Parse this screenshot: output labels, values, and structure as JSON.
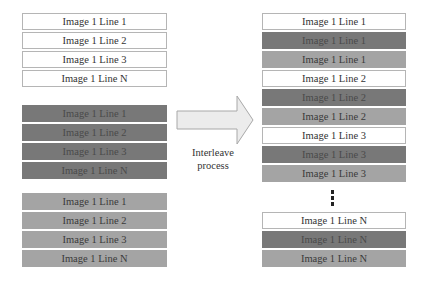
{
  "diagram": {
    "colors": {
      "white": "#ffffff",
      "dark": "#787878",
      "light": "#a4a4a4",
      "arrow": "#ececec",
      "border": "#b5b5b5"
    },
    "left": {
      "groups": [
        {
          "style": "white",
          "rows": [
            "Image 1 Line 1",
            "Image 1 Line 2",
            "Image 1 Line 3",
            "Image 1 Line N"
          ]
        },
        {
          "style": "dark",
          "rows": [
            "Image 1 Line 1",
            "Image 1 Line 2",
            "Image 1 Line 3",
            "Image 1 Line N"
          ]
        },
        {
          "style": "light",
          "rows": [
            "Image 1 Line 1",
            "Image 1 Line 2",
            "Image 1 Line 3",
            "Image 1 Line N"
          ]
        }
      ]
    },
    "arrow": {
      "label_line1": "Interleave",
      "label_line2": "process"
    },
    "right": {
      "rows": [
        {
          "style": "white",
          "text": "Image 1 Line 1"
        },
        {
          "style": "dark",
          "text": "Image 1 Line 1"
        },
        {
          "style": "light",
          "text": "Image 1 Line 1"
        },
        {
          "style": "white",
          "text": "Image 1 Line 2"
        },
        {
          "style": "dark",
          "text": "Image 1 Line 2"
        },
        {
          "style": "light",
          "text": "Image 1 Line 2"
        },
        {
          "style": "white",
          "text": "Image 1 Line 3"
        },
        {
          "style": "dark",
          "text": "Image 1 Line 3"
        },
        {
          "style": "light",
          "text": "Image 1 Line 3"
        },
        {
          "style": "white",
          "text": "Image 1 Line N"
        },
        {
          "style": "dark",
          "text": "Image 1 Line N"
        },
        {
          "style": "light",
          "text": "Image 1 Line N"
        }
      ],
      "ellipsis": "vertical-dots"
    }
  }
}
